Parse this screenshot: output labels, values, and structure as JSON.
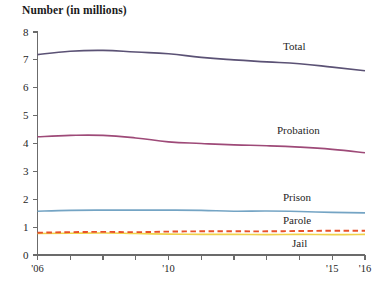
{
  "chart_data": {
    "type": "line",
    "title": "Number (in millions)",
    "xlabel": "",
    "ylabel": "Number (in millions)",
    "ylim": [
      0,
      8
    ],
    "xlim": [
      2006,
      2016
    ],
    "yticks": [
      0,
      1,
      2,
      3,
      4,
      5,
      6,
      7,
      8
    ],
    "ytick_labels": [
      "0",
      "1",
      "2",
      "3",
      "4",
      "5",
      "6",
      "7",
      "8"
    ],
    "x": [
      2006,
      2007,
      2008,
      2009,
      2010,
      2011,
      2012,
      2013,
      2014,
      2015,
      2016
    ],
    "xtick_values": [
      2006,
      2007,
      2008,
      2009,
      2010,
      2011,
      2012,
      2013,
      2014,
      2015,
      2016
    ],
    "xtick_labels": [
      "'06",
      "",
      "",
      "",
      "'10",
      "",
      "",
      "",
      "",
      "'15",
      "'16"
    ],
    "grid": false,
    "legend_position": "inline-right",
    "series": [
      {
        "name": "Total",
        "color": "#5b5275",
        "style": "solid",
        "label_y": 7.45,
        "values": [
          7.19,
          7.31,
          7.34,
          7.28,
          7.22,
          7.09,
          7.0,
          6.93,
          6.86,
          6.74,
          6.61
        ]
      },
      {
        "name": "Probation",
        "color": "#9e4a78",
        "style": "solid",
        "label_y": 4.45,
        "values": [
          4.24,
          4.29,
          4.29,
          4.2,
          4.06,
          4.0,
          3.95,
          3.92,
          3.87,
          3.79,
          3.67
        ]
      },
      {
        "name": "Prison",
        "color": "#74a4c4",
        "style": "solid",
        "label_y": 2.03,
        "values": [
          1.57,
          1.6,
          1.61,
          1.61,
          1.61,
          1.6,
          1.57,
          1.58,
          1.56,
          1.53,
          1.51
        ]
      },
      {
        "name": "Parole",
        "color": "#e8512a",
        "style": "dashed",
        "label_y": 1.22,
        "values": [
          0.8,
          0.82,
          0.83,
          0.82,
          0.84,
          0.85,
          0.85,
          0.85,
          0.86,
          0.87,
          0.87
        ]
      },
      {
        "name": "Jail",
        "color": "#f0d14a",
        "style": "solid",
        "label_y": 0.4,
        "values": [
          0.77,
          0.78,
          0.79,
          0.77,
          0.75,
          0.74,
          0.74,
          0.73,
          0.74,
          0.73,
          0.74
        ]
      }
    ]
  },
  "axes": {
    "axis_color": "#6b6b6b",
    "label_color": "#262626"
  }
}
